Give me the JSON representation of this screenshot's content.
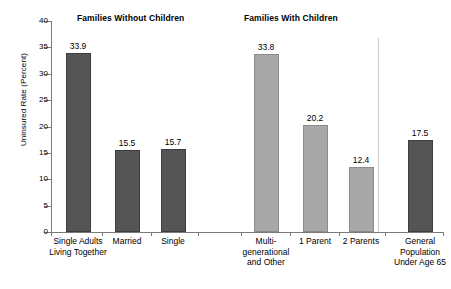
{
  "chart_data": {
    "type": "bar",
    "title": "",
    "xlabel": "",
    "ylabel": "Uninsured Rate  (Percent)",
    "ylim": [
      0,
      40
    ],
    "ytick_labels": [
      "0",
      "5",
      "10",
      "15",
      "20",
      "25",
      "30",
      "35",
      "40"
    ],
    "ytick_values": [
      0,
      5,
      10,
      15,
      20,
      25,
      30,
      35,
      40
    ],
    "grid": false,
    "legend": "none",
    "group_headers": [
      {
        "label": "Families Without Children"
      },
      {
        "label": "Families With Children"
      }
    ],
    "categories": [
      "Single Adults\nLiving Together",
      "Married",
      "Single",
      "Multi-\ngenerational\nand Other",
      "1 Parent",
      "2 Parents",
      "General\nPopulation\nUnder Age 65"
    ],
    "values": [
      33.9,
      15.5,
      15.7,
      33.8,
      20.2,
      12.4,
      17.5
    ],
    "value_labels": [
      "33.9",
      "15.5",
      "15.7",
      "33.8",
      "20.2",
      "12.4",
      "17.5"
    ],
    "bar_colors": [
      "dark",
      "dark",
      "dark",
      "light",
      "light",
      "light",
      "dark"
    ],
    "colors": {
      "dark_bar": "#555555",
      "light_bar": "#a8a8a8",
      "axis": "#7a7a7a",
      "divider": "#c9c9c9",
      "text": "#000000"
    }
  }
}
